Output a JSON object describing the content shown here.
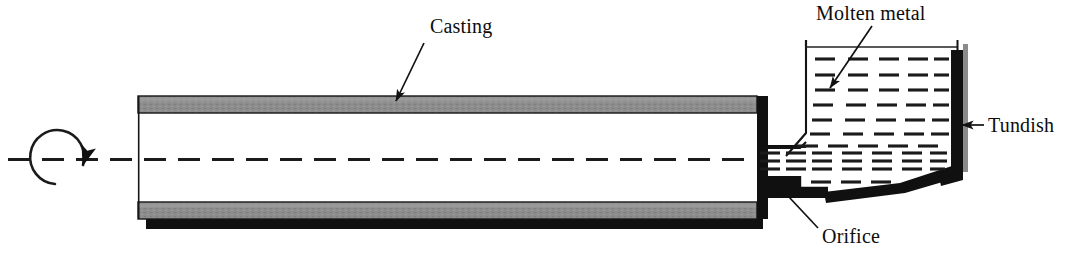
{
  "figure": {
    "type": "engineering-schematic",
    "background_color": "#ffffff"
  },
  "colors": {
    "mold_wall_gray": "#8c8c8c",
    "mold_wall_gray_light": "#9b9b9b",
    "shadow_black": "#101010",
    "line_black": "#111111",
    "text_black": "#0d0d0d",
    "liquid_dash": "#1b1b1b"
  },
  "labels": {
    "casting": "Casting",
    "molten_metal": "Molten metal",
    "tundish": "Tundish",
    "orifice": "Orifice"
  },
  "annotations": [
    {
      "name": "casting",
      "text": "Casting",
      "text_x": 430,
      "text_y": 31,
      "leader_from": [
        424,
        42
      ],
      "leader_to": [
        394,
        103
      ]
    },
    {
      "name": "molten-metal",
      "text": "Molten metal",
      "text_x": 817,
      "text_y": 18,
      "leader_from": [
        872,
        26
      ],
      "leader_to": [
        828,
        90
      ]
    },
    {
      "name": "tundish",
      "text": "Tundish",
      "text_x": 985,
      "text_y": 132,
      "leader_from": [
        983,
        125
      ],
      "leader_to": [
        960,
        125
      ]
    },
    {
      "name": "orifice",
      "text": "Orifice",
      "text_x": 822,
      "text_y": 240,
      "leader_from": [
        818,
        228
      ],
      "leader_to": [
        772,
        183
      ]
    }
  ],
  "parts": {
    "casting_tube": {
      "name": "casting",
      "left_x": 138,
      "right_x": 757,
      "top_wall": {
        "y_top": 96,
        "y_bottom": 113
      },
      "bottom_wall": {
        "y_top": 202,
        "y_bottom": 219
      },
      "shadow_bar": {
        "y_top": 219,
        "y_bottom": 229
      }
    },
    "rotation_arrow": {
      "name": "rotation-direction-arrow",
      "center_x": 60,
      "center_y": 159,
      "radius": 27,
      "direction": "clockwise"
    },
    "centerline": {
      "name": "axis-of-rotation",
      "y": 159,
      "x_start": 8,
      "x_end": 955,
      "style": "dashed"
    },
    "orifice": {
      "name": "orifice",
      "x_start": 757,
      "x_end": 800,
      "y_top": 148,
      "y_bottom": 176
    },
    "tundish": {
      "name": "tundish",
      "top_y": 40,
      "rim_left_x": 806,
      "rim_right_x": 958,
      "liquid_surface_y": 47,
      "left_wall_bottom_y": 133,
      "bottom_left_x": 825,
      "bottom_right_x": 958,
      "bottom_y_left": 198,
      "bottom_y_right": 170
    },
    "molten_metal": {
      "name": "molten-metal",
      "dash_rows": 11,
      "dash_cols": 6,
      "style": "horizontal dash grid"
    }
  }
}
